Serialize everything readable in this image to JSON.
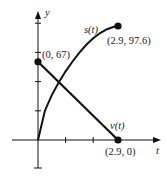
{
  "chart_data": {
    "type": "line",
    "title": "",
    "xlabel": "t",
    "ylabel": "y",
    "xlim": [
      -0.95,
      3.35
    ],
    "ylim": [
      -27,
      125
    ],
    "grid": false,
    "legend": "none (curves labeled inline)",
    "x_tick_step": 1,
    "y_tick_step": 25,
    "series": [
      {
        "name": "s(t)",
        "kind": "curve (concave, increasing)",
        "x": [
          0,
          0.25,
          0.5,
          0.75,
          1.0,
          1.25,
          1.5,
          1.75,
          2.0,
          2.25,
          2.5,
          2.75,
          2.9
        ],
        "values": [
          0,
          25.1,
          38.4,
          49.3,
          58.8,
          67.2,
          74.8,
          81.5,
          87.1,
          91.6,
          94.9,
          97.0,
          97.6
        ],
        "label": "s(t)"
      },
      {
        "name": "v(t)",
        "kind": "line (decreasing)",
        "x": [
          0,
          2.9
        ],
        "values": [
          67,
          0
        ],
        "label": "v(t)"
      }
    ],
    "annotations": [
      {
        "text": "(0, 67)",
        "x": 0,
        "y": 67
      },
      {
        "text": "(2.9, 97.6)",
        "x": 2.9,
        "y": 97.6
      },
      {
        "text": "(2.9, 0)",
        "x": 2.9,
        "y": 0
      }
    ]
  },
  "labels": {
    "x_axis": "t",
    "y_axis": "y",
    "s_curve": "s(t)",
    "v_line": "v(t)",
    "pt_start": "(0, 67)",
    "pt_s_end": "(2.9, 97.6)",
    "pt_v_end": "(2.9, 0)"
  },
  "colors": {
    "ink": "#111111",
    "text": "#222222",
    "background": "#ffffff"
  }
}
